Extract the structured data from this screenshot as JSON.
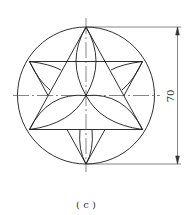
{
  "figure": {
    "caption": "( c )",
    "dimension_label": "70",
    "colors": {
      "stroke": "#1a1a1a",
      "background": "#ffffff"
    },
    "geometry": {
      "circle": {
        "cx": 86,
        "cy": 95.5,
        "r": 68.5
      },
      "description": "Circle with two overlapping equilateral triangles (hexagram), three inscribed circular arcs forming a trefoil, and small petal arcs in outer triangles"
    }
  }
}
